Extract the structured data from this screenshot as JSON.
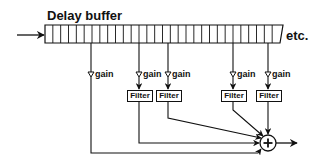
{
  "diagram": {
    "title": "Delay buffer",
    "continuation_label": "etc.",
    "buffer": {
      "x1": 45,
      "x2_top": 283,
      "x2_bottom": 280,
      "y1": 25,
      "y2": 43,
      "cell_count": 30
    },
    "input_arrow": {
      "x1": 17,
      "x2": 45,
      "y": 35
    },
    "colors": {
      "stroke": "#111111",
      "background": "#ffffff"
    },
    "taps": [
      {
        "id": "tap-1",
        "x": 91,
        "gain_label": "gain",
        "has_filter": false
      },
      {
        "id": "tap-2",
        "x": 139,
        "gain_label": "gain",
        "has_filter": true,
        "filter_label": "Filter"
      },
      {
        "id": "tap-3",
        "x": 168,
        "gain_label": "gain",
        "has_filter": true,
        "filter_label": "Filter"
      },
      {
        "id": "tap-4",
        "x": 233,
        "gain_label": "gain",
        "has_filter": true,
        "filter_label": "Filter"
      },
      {
        "id": "tap-5",
        "x": 268,
        "gain_label": "gain",
        "has_filter": true,
        "filter_label": "Filter"
      }
    ],
    "summing_node": {
      "symbol": "+",
      "cx": 268,
      "cy": 143,
      "r": 8
    },
    "output_arrow": {
      "x1": 276,
      "x2": 297,
      "y": 143
    }
  }
}
